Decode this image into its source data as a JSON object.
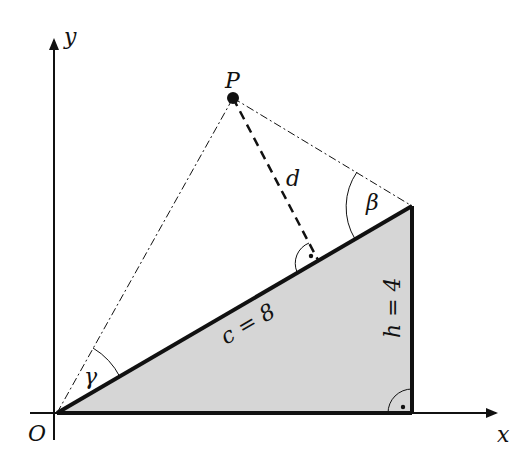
{
  "diagram": {
    "type": "geometry",
    "axes": {
      "x_label": "x",
      "y_label": "y",
      "origin_label": "O"
    },
    "point": {
      "label": "P"
    },
    "segments": {
      "hypotenuse": "c = 8",
      "height": "h = 4",
      "distance": "d"
    },
    "angles": {
      "beta": "β",
      "gamma": "γ"
    },
    "colors": {
      "fill": "#d6d6d6",
      "stroke": "#111111"
    }
  }
}
